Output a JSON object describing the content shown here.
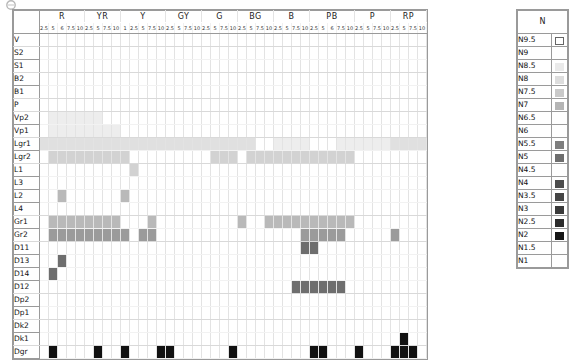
{
  "logo": {
    "icon": "circle-logo-icon"
  },
  "chart_data": {
    "type": "heatmap",
    "title": "",
    "xlabel": "",
    "ylabel": "",
    "legend_position": "right",
    "grid": true,
    "hue_groups": [
      {
        "name": "R",
        "ticks": [
          "2.5",
          "5",
          "6",
          "7.5",
          "10"
        ]
      },
      {
        "name": "YR",
        "ticks": [
          "2.5",
          "5",
          "7.5",
          "10"
        ]
      },
      {
        "name": "Y",
        "ticks": [
          "1",
          "2.5",
          "5",
          "7.5",
          "10"
        ]
      },
      {
        "name": "GY",
        "ticks": [
          "2.5",
          "5",
          "7.5",
          "10"
        ]
      },
      {
        "name": "G",
        "ticks": [
          "2.5",
          "5",
          "7.5",
          "10"
        ]
      },
      {
        "name": "BG",
        "ticks": [
          "2.5",
          "5",
          "7.5",
          "10"
        ]
      },
      {
        "name": "B",
        "ticks": [
          "2.5",
          "5",
          "7.5",
          "10"
        ]
      },
      {
        "name": "PB",
        "ticks": [
          "2.5",
          "5",
          "6",
          "7.5",
          "10"
        ]
      },
      {
        "name": "P",
        "ticks": [
          "2.5",
          "5",
          "7.5",
          "10"
        ]
      },
      {
        "name": "RP",
        "ticks": [
          "2.5",
          "5",
          "7.5",
          "10"
        ]
      }
    ],
    "tone_rows": [
      "V",
      "S2",
      "S1",
      "B2",
      "B1",
      "P",
      "Vp2",
      "Vp1",
      "Lgr1",
      "Lgr2",
      "L1",
      "L3",
      "L2",
      "L4",
      "Gr1",
      "Gr2",
      "D11",
      "D13",
      "D14",
      "D12",
      "Dp2",
      "Dp1",
      "Dk2",
      "Dk1",
      "Dgr"
    ],
    "palette": {
      "empty": "#ffffff",
      "vlight": "#ededed",
      "light": "#e0e0e0",
      "mlight": "#d2d2d2",
      "mid": "#b9b9b9",
      "mdark": "#9b9b9b",
      "dark": "#6e6e6e",
      "vdark": "#4a4a4a",
      "black": "#111111"
    },
    "marks": [
      {
        "row": "Vp2",
        "cols": [
          1,
          2,
          3,
          4,
          5,
          6
        ],
        "shade": "vlight"
      },
      {
        "row": "Vp1",
        "cols": [
          1,
          2,
          3,
          4,
          5,
          6,
          7,
          8
        ],
        "shade": "vlight"
      },
      {
        "row": "Lgr1",
        "cols": [
          0,
          1,
          2,
          3,
          4,
          5,
          6,
          7,
          8,
          9,
          10,
          11,
          12,
          13,
          14,
          15,
          16,
          17,
          18,
          19,
          20,
          21,
          22,
          23
        ],
        "shade": "light"
      },
      {
        "row": "Lgr1",
        "cols": [
          26,
          27,
          28,
          29
        ],
        "shade": "vlight"
      },
      {
        "row": "Lgr1",
        "cols": [
          33,
          34,
          35,
          36,
          37,
          38
        ],
        "shade": "vlight"
      },
      {
        "row": "Lgr1",
        "cols": [
          39,
          40,
          41,
          42,
          43
        ],
        "shade": "light"
      },
      {
        "row": "Lgr1",
        "cols": [
          44,
          45,
          46,
          47
        ],
        "shade": "vlight"
      },
      {
        "row": "Lgr2",
        "cols": [
          1,
          2,
          3,
          4,
          5,
          6,
          7,
          8,
          9
        ],
        "shade": "mlight"
      },
      {
        "row": "Lgr2",
        "cols": [
          19,
          20,
          21
        ],
        "shade": "mlight"
      },
      {
        "row": "Lgr2",
        "cols": [
          23,
          24,
          25,
          26,
          27,
          28,
          29,
          30,
          31,
          32
        ],
        "shade": "mlight"
      },
      {
        "row": "Lgr2",
        "cols": [
          33,
          34
        ],
        "shade": "mlight"
      },
      {
        "row": "Lgr2",
        "cols": [
          44,
          45
        ],
        "shade": "mlight"
      },
      {
        "row": "L1",
        "cols": [
          10
        ],
        "shade": "mlight"
      },
      {
        "row": "L2",
        "cols": [
          2
        ],
        "shade": "mid"
      },
      {
        "row": "L2",
        "cols": [
          9
        ],
        "shade": "mid"
      },
      {
        "row": "Gr1",
        "cols": [
          1,
          2,
          3,
          4,
          5,
          6,
          7,
          8
        ],
        "shade": "mid"
      },
      {
        "row": "Gr1",
        "cols": [
          12
        ],
        "shade": "mid"
      },
      {
        "row": "Gr1",
        "cols": [
          22
        ],
        "shade": "mid"
      },
      {
        "row": "Gr1",
        "cols": [
          25,
          26,
          27,
          28,
          29,
          30,
          31,
          32,
          33,
          34
        ],
        "shade": "mid"
      },
      {
        "row": "Gr2",
        "cols": [
          1,
          2,
          3,
          4,
          5,
          6,
          7,
          8,
          9
        ],
        "shade": "mdark"
      },
      {
        "row": "Gr2",
        "cols": [
          11,
          12
        ],
        "shade": "mdark"
      },
      {
        "row": "Gr2",
        "cols": [
          29,
          30,
          31,
          32,
          33
        ],
        "shade": "mdark"
      },
      {
        "row": "Gr2",
        "cols": [
          39
        ],
        "shade": "mdark"
      },
      {
        "row": "Gr2",
        "cols": [
          46
        ],
        "shade": "mdark"
      },
      {
        "row": "D11",
        "cols": [
          29,
          30
        ],
        "shade": "dark"
      },
      {
        "row": "D13",
        "cols": [
          2
        ],
        "shade": "dark"
      },
      {
        "row": "D14",
        "cols": [
          1
        ],
        "shade": "dark"
      },
      {
        "row": "D12",
        "cols": [
          28,
          29,
          30,
          31,
          32,
          33
        ],
        "shade": "dark"
      },
      {
        "row": "Dk1",
        "cols": [
          40
        ],
        "shade": "black"
      },
      {
        "row": "Dgr",
        "cols": [
          1
        ],
        "shade": "black"
      },
      {
        "row": "Dgr",
        "cols": [
          6
        ],
        "shade": "black"
      },
      {
        "row": "Dgr",
        "cols": [
          9
        ],
        "shade": "black"
      },
      {
        "row": "Dgr",
        "cols": [
          13,
          14
        ],
        "shade": "black"
      },
      {
        "row": "Dgr",
        "cols": [
          21
        ],
        "shade": "black"
      },
      {
        "row": "Dgr",
        "cols": [
          30,
          31
        ],
        "shade": "black"
      },
      {
        "row": "Dgr",
        "cols": [
          35
        ],
        "shade": "black"
      },
      {
        "row": "Dgr",
        "cols": [
          39,
          40,
          41
        ],
        "shade": "black"
      },
      {
        "row": "Dgr",
        "cols": [
          43,
          44
        ],
        "shade": "black"
      }
    ]
  },
  "neutral_legend": {
    "header": "N",
    "items": [
      {
        "label": "N9.5",
        "shade": "outline"
      },
      {
        "label": "N9",
        "shade": "none"
      },
      {
        "label": "N8.5",
        "shade": "#eaeaea"
      },
      {
        "label": "N8",
        "shade": "#dddddd"
      },
      {
        "label": "N7.5",
        "shade": "#c9c9c9"
      },
      {
        "label": "N7",
        "shade": "#b5b5b5"
      },
      {
        "label": "N6.5",
        "shade": "none"
      },
      {
        "label": "N6",
        "shade": "none"
      },
      {
        "label": "N5.5",
        "shade": "#7e7e7e"
      },
      {
        "label": "N5",
        "shade": "#6e6e6e"
      },
      {
        "label": "N4.5",
        "shade": "none"
      },
      {
        "label": "N4",
        "shade": "#4d4d4d"
      },
      {
        "label": "N3.5",
        "shade": "#454545"
      },
      {
        "label": "N3",
        "shade": "#3a3a3a"
      },
      {
        "label": "N2.5",
        "shade": "#2c2c2c"
      },
      {
        "label": "N2",
        "shade": "#151515"
      },
      {
        "label": "N1.5",
        "shade": "none"
      },
      {
        "label": "N1",
        "shade": "none"
      }
    ]
  }
}
